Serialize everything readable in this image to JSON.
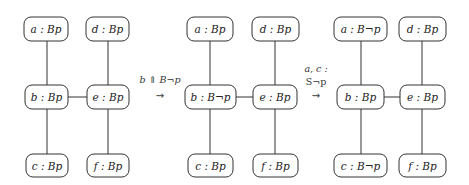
{
  "diagram": {
    "panels": [
      {
        "nodes": {
          "a": {
            "label": "a : Bp"
          },
          "d": {
            "label": "d : Bp"
          },
          "b": {
            "label": "b : Bp"
          },
          "e": {
            "label": "e : Bp"
          },
          "c": {
            "label": "c : Bp"
          },
          "f": {
            "label": "f : Bp"
          }
        }
      },
      {
        "nodes": {
          "a": {
            "label": "a : Bp"
          },
          "d": {
            "label": "d : Bp"
          },
          "b": {
            "label": "b : B¬p"
          },
          "e": {
            "label": "e : Bp"
          },
          "c": {
            "label": "c : Bp"
          },
          "f": {
            "label": "f : Bp"
          }
        }
      },
      {
        "nodes": {
          "a": {
            "label": "a : B¬p"
          },
          "d": {
            "label": "d : Bp"
          },
          "b": {
            "label": "b : Bp"
          },
          "e": {
            "label": "e : Bp"
          },
          "c": {
            "label": "c : B¬p"
          },
          "f": {
            "label": "f : Bp"
          }
        }
      }
    ],
    "edges": [
      [
        "a",
        "b"
      ],
      [
        "b",
        "c"
      ],
      [
        "d",
        "e"
      ],
      [
        "e",
        "f"
      ],
      [
        "b",
        "e"
      ]
    ],
    "transitions": [
      {
        "lines": [
          "b ⇑ B¬p"
        ],
        "arrow": "⇝"
      },
      {
        "lines": [
          "a, c :",
          "S¬p"
        ],
        "arrow": "⇝"
      }
    ]
  }
}
